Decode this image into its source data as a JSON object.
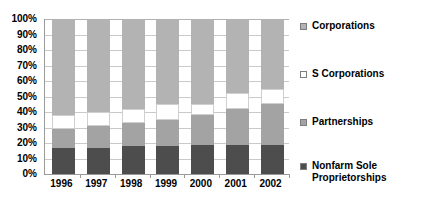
{
  "chart_data": {
    "type": "bar",
    "subtype": "100-percent-stacked-column",
    "title": "",
    "subtitle": "",
    "xlabel": "",
    "ylabel": "",
    "categories": [
      "1996",
      "1997",
      "1998",
      "1999",
      "2000",
      "2001",
      "2002"
    ],
    "ylim": [
      0,
      100
    ],
    "y_unit": "%",
    "y_tick_labels": [
      "100%",
      "90%",
      "80%",
      "70%",
      "60%",
      "50%",
      "40%",
      "30%",
      "20%",
      "10%",
      "0%"
    ],
    "y_tick_values": [
      100,
      90,
      80,
      70,
      60,
      50,
      40,
      30,
      20,
      10,
      0
    ],
    "grid": true,
    "grid_axis": "y",
    "legend_position": "right",
    "stack_order_bottom_to_top": [
      "Nonfarm Sole Proprietorships",
      "Partnerships",
      "S Corporations",
      "Corporations"
    ],
    "series": [
      {
        "name": "Corporations",
        "color": "#b3b3b3",
        "values": [
          62,
          60,
          58,
          55,
          55,
          48,
          45
        ]
      },
      {
        "name": "S Corporations",
        "color": "#ffffff",
        "values": [
          9,
          9,
          9,
          10,
          7,
          10,
          10
        ]
      },
      {
        "name": "Partnerships",
        "color": "#a3a3a3",
        "values": [
          12,
          14,
          15,
          17,
          19,
          23,
          26
        ]
      },
      {
        "name": "Nonfarm Sole Proprietorships",
        "color": "#4d4d4d",
        "values": [
          17,
          17,
          18,
          18,
          19,
          19,
          19
        ]
      }
    ]
  },
  "legend": {
    "items": [
      {
        "label": "Corporations",
        "color": "#b3b3b3"
      },
      {
        "label": "S Corporations",
        "color": "#ffffff"
      },
      {
        "label": "Partnerships",
        "color": "#a3a3a3"
      },
      {
        "label": "Nonfarm Sole\nProprietorships",
        "color": "#4d4d4d"
      }
    ]
  },
  "colors": {
    "corporations": "#b3b3b3",
    "s_corporations": "#ffffff",
    "partnerships": "#a3a3a3",
    "nonfarm_sole_proprietorships": "#4d4d4d",
    "gridline": "#c9c9c9",
    "axis": "#9a9a9a",
    "background": "#ffffff",
    "text": "#000000"
  }
}
